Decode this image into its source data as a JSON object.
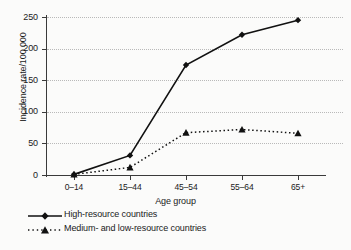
{
  "chart_data": {
    "type": "line",
    "title": "",
    "xlabel": "Age group",
    "ylabel": "Incidence rate/100 000",
    "categories": [
      "0–14",
      "15–44",
      "45–54",
      "55–64",
      "65+"
    ],
    "ylim": [
      0,
      250
    ],
    "yticks": [
      0,
      50,
      100,
      150,
      200,
      250
    ],
    "ytick_labels": [
      "0",
      "50",
      "100",
      "150",
      "200",
      "250"
    ],
    "grid": true,
    "legend_position": "below-left",
    "series": [
      {
        "name": "High-resource countries",
        "values": [
          1,
          31,
          174,
          222,
          245
        ],
        "line_style": "solid",
        "marker": "diamond",
        "color": "#111111"
      },
      {
        "name": "Medium- and low-resource countries",
        "values": [
          1,
          12,
          67,
          72,
          66
        ],
        "line_style": "dotted",
        "marker": "triangle",
        "color": "#111111"
      }
    ]
  },
  "figure": {
    "background_color": "#fbfbfa",
    "grid_color": "#b9b9b9",
    "axis_color": "#3a3a3a"
  }
}
